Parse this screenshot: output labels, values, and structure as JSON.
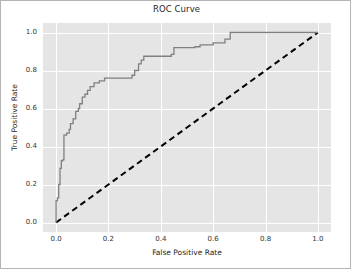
{
  "chart_data": {
    "type": "line",
    "title": "ROC Curve",
    "xlabel": "False Positive Rate",
    "ylabel": "True Positive Rate",
    "xlim": [
      -0.05,
      1.05
    ],
    "ylim": [
      -0.05,
      1.05
    ],
    "grid": true,
    "legend": null,
    "xticks": [
      "0.0",
      "0.2",
      "0.4",
      "0.6",
      "0.8",
      "1.0"
    ],
    "xtick_values": [
      0.0,
      0.2,
      0.4,
      0.6,
      0.8,
      1.0
    ],
    "yticks": [
      "0.0",
      "0.2",
      "0.4",
      "0.6",
      "0.8",
      "1.0"
    ],
    "ytick_values": [
      0.0,
      0.2,
      0.4,
      0.6,
      0.8,
      1.0
    ],
    "series": [
      {
        "name": "ROC curve",
        "style": "solid-step",
        "color": "#808080",
        "x": [
          0.0,
          0.0,
          0.005,
          0.005,
          0.01,
          0.01,
          0.015,
          0.015,
          0.02,
          0.02,
          0.025,
          0.025,
          0.03,
          0.03,
          0.04,
          0.04,
          0.05,
          0.05,
          0.055,
          0.055,
          0.065,
          0.065,
          0.075,
          0.075,
          0.085,
          0.085,
          0.09,
          0.09,
          0.1,
          0.1,
          0.11,
          0.11,
          0.12,
          0.12,
          0.13,
          0.13,
          0.145,
          0.145,
          0.165,
          0.165,
          0.185,
          0.185,
          0.29,
          0.29,
          0.3,
          0.3,
          0.315,
          0.315,
          0.325,
          0.325,
          0.335,
          0.335,
          0.44,
          0.44,
          0.45,
          0.45,
          0.53,
          0.53,
          0.55,
          0.55,
          0.6,
          0.6,
          0.645,
          0.645,
          0.665,
          0.665,
          1.0
        ],
        "y": [
          0.0,
          0.115,
          0.115,
          0.13,
          0.13,
          0.2,
          0.2,
          0.285,
          0.285,
          0.325,
          0.325,
          0.33,
          0.33,
          0.46,
          0.46,
          0.47,
          0.47,
          0.49,
          0.49,
          0.52,
          0.52,
          0.545,
          0.545,
          0.585,
          0.585,
          0.6,
          0.6,
          0.625,
          0.625,
          0.66,
          0.66,
          0.675,
          0.675,
          0.695,
          0.695,
          0.715,
          0.715,
          0.735,
          0.735,
          0.745,
          0.745,
          0.76,
          0.76,
          0.775,
          0.775,
          0.8,
          0.8,
          0.835,
          0.835,
          0.855,
          0.855,
          0.875,
          0.875,
          0.885,
          0.885,
          0.92,
          0.92,
          0.925,
          0.925,
          0.935,
          0.935,
          0.945,
          0.945,
          0.965,
          0.965,
          1.0,
          1.0
        ]
      },
      {
        "name": "chance-diagonal",
        "style": "dashed",
        "color": "#000000",
        "x": [
          0.0,
          1.0
        ],
        "y": [
          0.0,
          1.0
        ]
      }
    ]
  }
}
